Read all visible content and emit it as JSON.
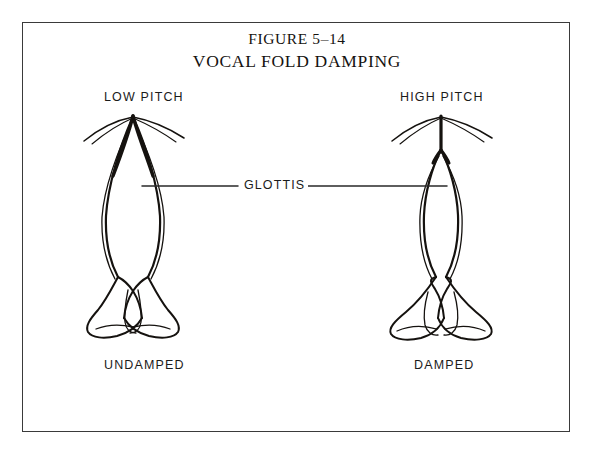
{
  "figure": {
    "title_number": "FIGURE 5–14",
    "title_name": "VOCAL FOLD DAMPING",
    "border_color": "#3a3a3a",
    "ink_color": "#15120f",
    "background_color": "#ffffff"
  },
  "labels": {
    "low_pitch": "LOW PITCH",
    "high_pitch": "HIGH PITCH",
    "glottis": "GLOTTIS",
    "undamped": "UNDAMPED",
    "damped": "DAMPED"
  },
  "diagram": {
    "left_panel": {
      "state_label": "UNDAMPED",
      "pitch_label": "LOW PITCH",
      "description": "Long narrow lens-shaped glottal opening between elongated vocal folds with arytenoid cartilages splayed below"
    },
    "right_panel": {
      "state_label": "DAMPED",
      "pitch_label": "HIGH PITCH",
      "description": "Shorter narrower glottal opening with shortened thickened vocal folds and widely splayed arytenoid cartilages"
    },
    "callout": {
      "label": "GLOTTIS",
      "points_to": [
        "left_panel_glottis",
        "right_panel_glottis"
      ]
    }
  }
}
